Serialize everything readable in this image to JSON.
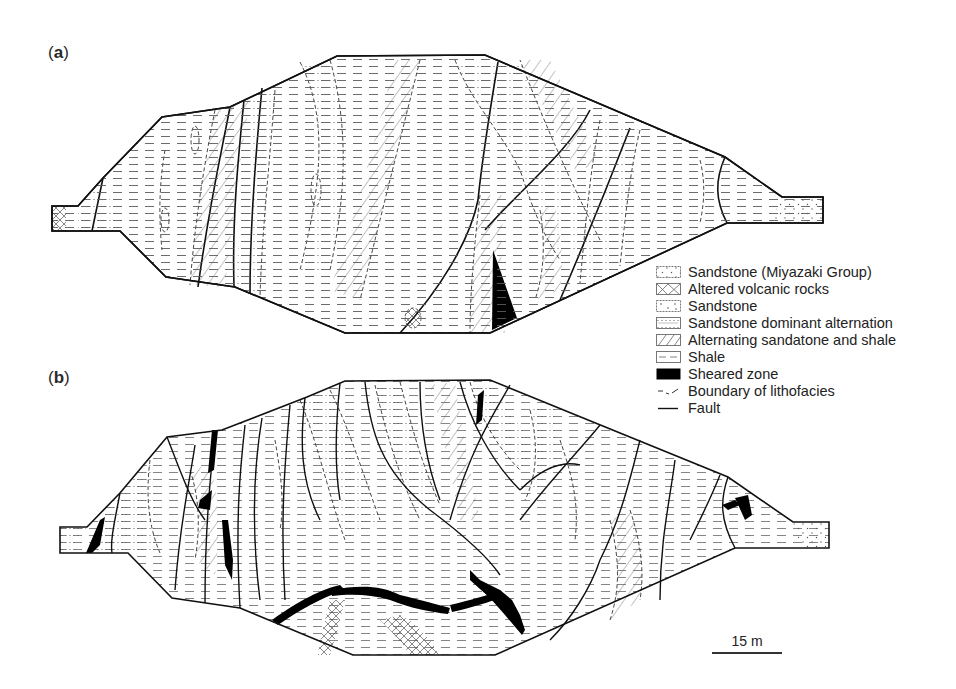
{
  "figure": {
    "panels": [
      {
        "label_open": "(",
        "label_letter": "a",
        "label_close": ")"
      },
      {
        "label_open": "(",
        "label_letter": "b",
        "label_close": ")"
      }
    ]
  },
  "legend": {
    "items": [
      {
        "label": "Sandstone (Miyazaki Group)",
        "symbol": "sparse-dot-pattern"
      },
      {
        "label": "Altered volcanic rocks",
        "symbol": "cross-hatch-pattern"
      },
      {
        "label": "Sandstone",
        "symbol": "dot-pattern"
      },
      {
        "label": "Sandstone dominant alternation",
        "symbol": "dotted-line-pattern"
      },
      {
        "label": "Alternating sandatone and shale",
        "symbol": "diagonal-hatch-pattern"
      },
      {
        "label": "Shale",
        "symbol": "dash-pattern"
      },
      {
        "label": "Sheared zone",
        "symbol": "solid-black",
        "color": "#000000"
      },
      {
        "label": "Boundary of lithofacies",
        "symbol": "dashed-line"
      },
      {
        "label": "Fault",
        "symbol": "solid-line"
      }
    ]
  },
  "scale_bar": {
    "label": "15 m"
  }
}
